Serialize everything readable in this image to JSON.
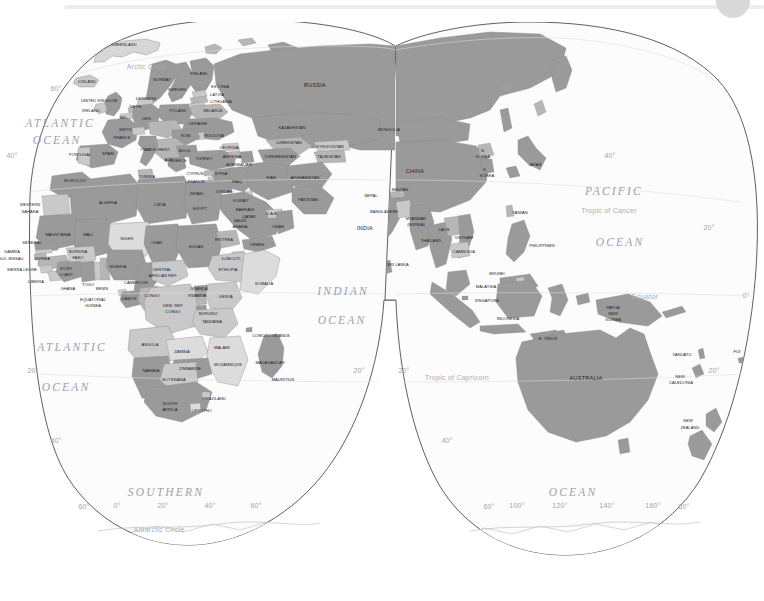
{
  "app_chrome": {
    "bar_color": "#ededed",
    "avatar_color": "#d9d9d9"
  },
  "map": {
    "title": "World Map — Eastern Hemisphere",
    "projection": "interrupted goode-like gores",
    "colors": {
      "land_dark": "#9a9a9a",
      "land_light": "#c9c9c9",
      "land_pale": "#e6e6e6",
      "ocean": "#fbfbfb",
      "outline": "#555555",
      "border": "#8a8a8a",
      "ocean_label": "#9aa3ab",
      "graticule_label": "#9fa6ac",
      "country_label": "#1d1d1d"
    },
    "oceans": [
      {
        "name": "ATLANTIC",
        "x": 60,
        "y": 124,
        "size": "sm"
      },
      {
        "name": "OCEAN",
        "x": 57,
        "y": 141,
        "size": "sm"
      },
      {
        "name": "ATLANTIC",
        "x": 72,
        "y": 348,
        "size": "sm"
      },
      {
        "name": "OCEAN",
        "x": 66,
        "y": 388,
        "size": "sm"
      },
      {
        "name": "INDIAN",
        "x": 343,
        "y": 292,
        "size": "sm"
      },
      {
        "name": "OCEAN",
        "x": 342,
        "y": 321,
        "size": "sm"
      },
      {
        "name": "PACIFIC",
        "x": 614,
        "y": 192,
        "size": "sm"
      },
      {
        "name": "OCEAN",
        "x": 620,
        "y": 243,
        "size": "sm"
      },
      {
        "name": "SOUTHERN",
        "x": 166,
        "y": 493,
        "size": "sm"
      },
      {
        "name": "OCEAN",
        "x": 573,
        "y": 493,
        "size": "sm"
      }
    ],
    "reference_lines": [
      {
        "name": "Arctic Circle",
        "x": 147,
        "y": 67
      },
      {
        "name": "Tropic of Cancer",
        "x": 609,
        "y": 211
      },
      {
        "name": "Equator",
        "x": 645,
        "y": 297
      },
      {
        "name": "Tropic of Capricorn",
        "x": 457,
        "y": 378
      },
      {
        "name": "Antarctic Circle",
        "x": 159,
        "y": 530
      }
    ],
    "graticule_labels": [
      {
        "text": "60°",
        "x": 56,
        "y": 89
      },
      {
        "text": "40°",
        "x": 12,
        "y": 156
      },
      {
        "text": "20°",
        "x": 33,
        "y": 371
      },
      {
        "text": "40°",
        "x": 56,
        "y": 441
      },
      {
        "text": "60°",
        "x": 84,
        "y": 507
      },
      {
        "text": "20°",
        "x": 359,
        "y": 371
      },
      {
        "text": "20°",
        "x": 404,
        "y": 371
      },
      {
        "text": "40°",
        "x": 447,
        "y": 441
      },
      {
        "text": "60°",
        "x": 489,
        "y": 507
      },
      {
        "text": "0°",
        "x": 117,
        "y": 506
      },
      {
        "text": "20°",
        "x": 163,
        "y": 506
      },
      {
        "text": "40°",
        "x": 210,
        "y": 506
      },
      {
        "text": "60°",
        "x": 256,
        "y": 506
      },
      {
        "text": "100°",
        "x": 517,
        "y": 506
      },
      {
        "text": "120°",
        "x": 560,
        "y": 506
      },
      {
        "text": "140°",
        "x": 607,
        "y": 506
      },
      {
        "text": "160°",
        "x": 653,
        "y": 506
      },
      {
        "text": "60°",
        "x": 684,
        "y": 507
      },
      {
        "text": "60°",
        "x": 508,
        "y": 89
      },
      {
        "text": "40°",
        "x": 610,
        "y": 156
      },
      {
        "text": "20°",
        "x": 709,
        "y": 228
      },
      {
        "text": "0°",
        "x": 746,
        "y": 296
      },
      {
        "text": "20°",
        "x": 714,
        "y": 371
      }
    ],
    "countries": [
      {
        "name": "GREENLAND",
        "x": 124,
        "y": 45,
        "cls": "tiny"
      },
      {
        "name": "ICELAND",
        "x": 87,
        "y": 82,
        "cls": "tiny"
      },
      {
        "name": "NORWAY",
        "x": 162,
        "y": 80,
        "cls": "tiny"
      },
      {
        "name": "FINLAND",
        "x": 199,
        "y": 74,
        "cls": "tiny"
      },
      {
        "name": "SWEDEN",
        "x": 177,
        "y": 90,
        "cls": "tiny"
      },
      {
        "name": "ESTONIA",
        "x": 220,
        "y": 87,
        "cls": "tiny"
      },
      {
        "name": "LATVIA",
        "x": 217,
        "y": 95,
        "cls": "tiny"
      },
      {
        "name": "LITHUANIA",
        "x": 221,
        "y": 102,
        "cls": "tiny"
      },
      {
        "name": "UNITED KINGDOM",
        "x": 99,
        "y": 101,
        "cls": "tiny"
      },
      {
        "name": "DENMARK",
        "x": 146,
        "y": 99,
        "cls": "tiny"
      },
      {
        "name": "NETH.",
        "x": 136,
        "y": 107,
        "cls": "tiny"
      },
      {
        "name": "IRELAND",
        "x": 91,
        "y": 111,
        "cls": "tiny"
      },
      {
        "name": "POLAND",
        "x": 178,
        "y": 111,
        "cls": "tiny"
      },
      {
        "name": "BELARUS",
        "x": 213,
        "y": 111,
        "cls": "tiny"
      },
      {
        "name": "BEL.",
        "x": 124,
        "y": 118,
        "cls": "tiny"
      },
      {
        "name": "GER.",
        "x": 147,
        "y": 119,
        "cls": "tiny"
      },
      {
        "name": "UKRAINE",
        "x": 198,
        "y": 124,
        "cls": "tiny"
      },
      {
        "name": "SWITZ.",
        "x": 126,
        "y": 130,
        "cls": "tiny"
      },
      {
        "name": "FRANCE",
        "x": 122,
        "y": 138,
        "cls": "tiny"
      },
      {
        "name": "ROM.",
        "x": 186,
        "y": 136,
        "cls": "tiny"
      },
      {
        "name": "MOLDOVA",
        "x": 214,
        "y": 136,
        "cls": "tiny"
      },
      {
        "name": "ITALY",
        "x": 146,
        "y": 150,
        "cls": "tiny"
      },
      {
        "name": "BOS./HERZ.",
        "x": 159,
        "y": 150,
        "cls": "tiny"
      },
      {
        "name": "BULG.",
        "x": 185,
        "y": 151,
        "cls": "tiny"
      },
      {
        "name": "GEORGIA",
        "x": 229,
        "y": 148,
        "cls": "tiny"
      },
      {
        "name": "PORTUGAL",
        "x": 80,
        "y": 155,
        "cls": "tiny"
      },
      {
        "name": "SPAIN",
        "x": 108,
        "y": 154,
        "cls": "tiny"
      },
      {
        "name": "GREECE",
        "x": 178,
        "y": 161,
        "cls": "tiny"
      },
      {
        "name": "TURKEY",
        "x": 204,
        "y": 159,
        "cls": "tiny"
      },
      {
        "name": "ARMENIA",
        "x": 232,
        "y": 157,
        "cls": "tiny"
      },
      {
        "name": "AZERBAIJAN",
        "x": 239,
        "y": 165,
        "cls": "tiny"
      },
      {
        "name": "ALB.",
        "x": 169,
        "y": 160,
        "cls": "tiny"
      },
      {
        "name": "CYPRUS",
        "x": 195,
        "y": 174,
        "cls": "tiny"
      },
      {
        "name": "SYRIA",
        "x": 221,
        "y": 174,
        "cls": "tiny"
      },
      {
        "name": "LEBANON",
        "x": 195,
        "y": 182,
        "cls": "tiny"
      },
      {
        "name": "IRAQ",
        "x": 237,
        "y": 182,
        "cls": "tiny"
      },
      {
        "name": "MOROCCO",
        "x": 75,
        "y": 181,
        "cls": "tiny"
      },
      {
        "name": "TUNISIA",
        "x": 147,
        "y": 177,
        "cls": "tiny"
      },
      {
        "name": "ISRAEL",
        "x": 197,
        "y": 194,
        "cls": "tiny"
      },
      {
        "name": "JORDAN",
        "x": 224,
        "y": 192,
        "cls": "tiny"
      },
      {
        "name": "IRAN",
        "x": 271,
        "y": 178,
        "cls": "tiny"
      },
      {
        "name": "TURKMENISTAN",
        "x": 280,
        "y": 157,
        "cls": "tiny"
      },
      {
        "name": "UZBEKISTAN",
        "x": 289,
        "y": 143,
        "cls": "tiny"
      },
      {
        "name": "KAZAKHSTAN",
        "x": 292,
        "y": 128,
        "cls": "tiny"
      },
      {
        "name": "TAJIKISTAN",
        "x": 329,
        "y": 157,
        "cls": "tiny"
      },
      {
        "name": "KYRGYZSTAN",
        "x": 330,
        "y": 147,
        "cls": "tiny"
      },
      {
        "name": "AFGHANISTAN",
        "x": 305,
        "y": 178,
        "cls": "tiny"
      },
      {
        "name": "PAKISTAN",
        "x": 308,
        "y": 200,
        "cls": "tiny"
      },
      {
        "name": "WESTERN",
        "x": 30,
        "y": 205,
        "cls": "tiny"
      },
      {
        "name": "SAHARA",
        "x": 30,
        "y": 212,
        "cls": "tiny"
      },
      {
        "name": "ALGERIA",
        "x": 108,
        "y": 203,
        "cls": "tiny"
      },
      {
        "name": "LIBYA",
        "x": 160,
        "y": 205,
        "cls": "tiny"
      },
      {
        "name": "EGYPT",
        "x": 200,
        "y": 209,
        "cls": "tiny"
      },
      {
        "name": "KUWAIT",
        "x": 241,
        "y": 201,
        "cls": "tiny"
      },
      {
        "name": "BAHRAIN",
        "x": 245,
        "y": 210,
        "cls": "tiny"
      },
      {
        "name": "QATAR",
        "x": 249,
        "y": 217,
        "cls": "tiny"
      },
      {
        "name": "U.A.E.",
        "x": 272,
        "y": 214,
        "cls": "tiny"
      },
      {
        "name": "SAUDI",
        "x": 240,
        "y": 221,
        "cls": "tiny"
      },
      {
        "name": "ARABIA",
        "x": 240,
        "y": 227,
        "cls": "tiny"
      },
      {
        "name": "OMAN",
        "x": 278,
        "y": 227,
        "cls": "tiny"
      },
      {
        "name": "MAURITANIA",
        "x": 58,
        "y": 235,
        "cls": "tiny"
      },
      {
        "name": "MALI",
        "x": 88,
        "y": 235,
        "cls": "tiny"
      },
      {
        "name": "NIGER",
        "x": 127,
        "y": 239,
        "cls": "tiny"
      },
      {
        "name": "CHAD",
        "x": 157,
        "y": 243,
        "cls": "tiny"
      },
      {
        "name": "SUDAN",
        "x": 196,
        "y": 247,
        "cls": "tiny"
      },
      {
        "name": "ERITREA",
        "x": 224,
        "y": 240,
        "cls": "tiny"
      },
      {
        "name": "YEMEN",
        "x": 257,
        "y": 245,
        "cls": "tiny"
      },
      {
        "name": "SENEGAL",
        "x": 32,
        "y": 243,
        "cls": "tiny"
      },
      {
        "name": "GAMBIA",
        "x": 12,
        "y": 252,
        "cls": "tiny"
      },
      {
        "name": "GUI.-BISSAU",
        "x": 11,
        "y": 259,
        "cls": "tiny"
      },
      {
        "name": "GUINEA",
        "x": 42,
        "y": 259,
        "cls": "tiny"
      },
      {
        "name": "BURKINA",
        "x": 78,
        "y": 252,
        "cls": "tiny"
      },
      {
        "name": "FASO",
        "x": 78,
        "y": 258,
        "cls": "tiny"
      },
      {
        "name": "SIERRA LEONE",
        "x": 22,
        "y": 270,
        "cls": "tiny"
      },
      {
        "name": "IVORY",
        "x": 66,
        "y": 269,
        "cls": "tiny"
      },
      {
        "name": "COAST",
        "x": 66,
        "y": 275,
        "cls": "tiny"
      },
      {
        "name": "NIGERIA",
        "x": 118,
        "y": 267,
        "cls": "tiny"
      },
      {
        "name": "CENTRAL",
        "x": 162,
        "y": 270,
        "cls": "tiny"
      },
      {
        "name": "AFRICAN REP.",
        "x": 163,
        "y": 276,
        "cls": "tiny"
      },
      {
        "name": "DJIBOUTI",
        "x": 231,
        "y": 259,
        "cls": "tiny"
      },
      {
        "name": "ETHIOPIA",
        "x": 228,
        "y": 270,
        "cls": "tiny"
      },
      {
        "name": "SOMALIA",
        "x": 264,
        "y": 284,
        "cls": "tiny"
      },
      {
        "name": "LIBERIA",
        "x": 36,
        "y": 282,
        "cls": "tiny"
      },
      {
        "name": "GHANA",
        "x": 68,
        "y": 289,
        "cls": "tiny"
      },
      {
        "name": "TOGO",
        "x": 88,
        "y": 285,
        "cls": "tiny"
      },
      {
        "name": "BENIN",
        "x": 102,
        "y": 289,
        "cls": "tiny"
      },
      {
        "name": "CAMEROON",
        "x": 136,
        "y": 283,
        "cls": "tiny"
      },
      {
        "name": "EQUATORIAL",
        "x": 93,
        "y": 300,
        "cls": "tiny"
      },
      {
        "name": "GUINEA",
        "x": 93,
        "y": 306,
        "cls": "tiny"
      },
      {
        "name": "GABON",
        "x": 129,
        "y": 299,
        "cls": "tiny"
      },
      {
        "name": "CONGO",
        "x": 152,
        "y": 296,
        "cls": "tiny"
      },
      {
        "name": "DEM. REP.",
        "x": 173,
        "y": 306,
        "cls": "tiny"
      },
      {
        "name": "CONGO",
        "x": 173,
        "y": 312,
        "cls": "tiny"
      },
      {
        "name": "RWANDA",
        "x": 197,
        "y": 296,
        "cls": "tiny"
      },
      {
        "name": "UGANDA",
        "x": 199,
        "y": 289,
        "cls": "tiny"
      },
      {
        "name": "KENYA",
        "x": 226,
        "y": 297,
        "cls": "tiny"
      },
      {
        "name": "BURUNDI",
        "x": 208,
        "y": 314,
        "cls": "tiny"
      },
      {
        "name": "TANZANIA",
        "x": 212,
        "y": 322,
        "cls": "tiny"
      },
      {
        "name": "COMORO ISLANDS",
        "x": 271,
        "y": 336,
        "cls": "tiny"
      },
      {
        "name": "ANGOLA",
        "x": 150,
        "y": 345,
        "cls": "tiny"
      },
      {
        "name": "ZAMBIA",
        "x": 182,
        "y": 352,
        "cls": "tiny"
      },
      {
        "name": "MALAWI",
        "x": 222,
        "y": 348,
        "cls": "tiny"
      },
      {
        "name": "MOZAMBIQUE",
        "x": 228,
        "y": 365,
        "cls": "tiny"
      },
      {
        "name": "MADAGASCAR",
        "x": 270,
        "y": 363,
        "cls": "tiny"
      },
      {
        "name": "ZIMBABWE",
        "x": 190,
        "y": 369,
        "cls": "tiny"
      },
      {
        "name": "NAMIBIA",
        "x": 151,
        "y": 371,
        "cls": "tiny"
      },
      {
        "name": "BOTSWANA",
        "x": 174,
        "y": 380,
        "cls": "tiny"
      },
      {
        "name": "MAURITIUS",
        "x": 283,
        "y": 380,
        "cls": "tiny"
      },
      {
        "name": "SWAZILAND",
        "x": 214,
        "y": 399,
        "cls": "tiny"
      },
      {
        "name": "SOUTH",
        "x": 170,
        "y": 404,
        "cls": "tiny"
      },
      {
        "name": "AFRICA",
        "x": 170,
        "y": 410,
        "cls": "tiny"
      },
      {
        "name": "LESOTHO",
        "x": 202,
        "y": 411,
        "cls": "tiny"
      },
      {
        "name": "RUSSIA",
        "x": 315,
        "y": 86,
        "cls": "mid"
      },
      {
        "name": "MONGOLIA",
        "x": 389,
        "y": 130,
        "cls": "tiny"
      },
      {
        "name": "CHINA",
        "x": 415,
        "y": 172,
        "cls": "mid"
      },
      {
        "name": "N.",
        "x": 483,
        "y": 151,
        "cls": "tiny"
      },
      {
        "name": "KOREA",
        "x": 483,
        "y": 157,
        "cls": "tiny"
      },
      {
        "name": "S.",
        "x": 485,
        "y": 170,
        "cls": "tiny"
      },
      {
        "name": "KOREA",
        "x": 487,
        "y": 176,
        "cls": "tiny"
      },
      {
        "name": "JAPAN",
        "x": 535,
        "y": 165,
        "cls": "tiny"
      },
      {
        "name": "NEPAL",
        "x": 371,
        "y": 196,
        "cls": "tiny"
      },
      {
        "name": "BHUTAN",
        "x": 400,
        "y": 190,
        "cls": "tiny"
      },
      {
        "name": "BANGLADESH",
        "x": 384,
        "y": 212,
        "cls": "tiny"
      },
      {
        "name": "INDIA",
        "x": 365,
        "y": 229,
        "cls": "mid"
      },
      {
        "name": "MYANMAR",
        "x": 416,
        "y": 219,
        "cls": "tiny"
      },
      {
        "name": "(BURMA)",
        "x": 416,
        "y": 225,
        "cls": "tiny"
      },
      {
        "name": "TAIWAN",
        "x": 520,
        "y": 213,
        "cls": "tiny"
      },
      {
        "name": "LAOS",
        "x": 444,
        "y": 230,
        "cls": "tiny"
      },
      {
        "name": "THAILAND",
        "x": 431,
        "y": 241,
        "cls": "tiny"
      },
      {
        "name": "VIETNAM",
        "x": 464,
        "y": 238,
        "cls": "tiny"
      },
      {
        "name": "CAMBODIA",
        "x": 464,
        "y": 252,
        "cls": "tiny"
      },
      {
        "name": "PHILIPPINES",
        "x": 542,
        "y": 246,
        "cls": "tiny"
      },
      {
        "name": "SRI LANKA",
        "x": 398,
        "y": 265,
        "cls": "tiny"
      },
      {
        "name": "BRUNEI",
        "x": 497,
        "y": 274,
        "cls": "tiny"
      },
      {
        "name": "MALAYSIA",
        "x": 486,
        "y": 287,
        "cls": "tiny"
      },
      {
        "name": "SINGAPORE",
        "x": 487,
        "y": 301,
        "cls": "tiny"
      },
      {
        "name": "INDONESIA",
        "x": 508,
        "y": 319,
        "cls": "tiny"
      },
      {
        "name": "E. TIMOR",
        "x": 548,
        "y": 339,
        "cls": "tiny"
      },
      {
        "name": "PAPUA",
        "x": 613,
        "y": 308,
        "cls": "tiny"
      },
      {
        "name": "NEW",
        "x": 613,
        "y": 314,
        "cls": "tiny"
      },
      {
        "name": "GUINEA",
        "x": 613,
        "y": 320,
        "cls": "tiny"
      },
      {
        "name": "AUSTRALIA",
        "x": 586,
        "y": 379,
        "cls": "mid"
      },
      {
        "name": "VANUATU",
        "x": 682,
        "y": 355,
        "cls": "tiny"
      },
      {
        "name": "FIJI",
        "x": 737,
        "y": 352,
        "cls": "tiny"
      },
      {
        "name": "NEW",
        "x": 680,
        "y": 377,
        "cls": "tiny"
      },
      {
        "name": "CALEDONIA",
        "x": 681,
        "y": 383,
        "cls": "tiny"
      },
      {
        "name": "NEW",
        "x": 688,
        "y": 421,
        "cls": "tiny"
      },
      {
        "name": "ZEALAND",
        "x": 690,
        "y": 428,
        "cls": "tiny"
      }
    ]
  }
}
